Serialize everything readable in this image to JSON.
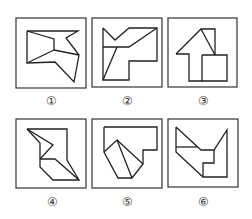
{
  "figures": [
    {
      "label": "①",
      "frame": [
        16,
        18,
        70,
        70
      ],
      "label_pos": [
        51,
        101
      ],
      "polylines": [
        [
          [
            27,
            31
          ],
          [
            78,
            31
          ],
          [
            66,
            38
          ],
          [
            79,
            55
          ],
          [
            74,
            82
          ],
          [
            55,
            62
          ],
          [
            27,
            63
          ],
          [
            27,
            31
          ]
        ],
        [
          [
            27,
            31
          ],
          [
            54,
            39
          ],
          [
            54,
            50
          ]
        ],
        [
          [
            54,
            50
          ],
          [
            27,
            63
          ]
        ],
        [
          [
            54,
            50
          ],
          [
            79,
            55
          ]
        ]
      ]
    },
    {
      "label": "②",
      "frame": [
        92,
        18,
        70,
        69
      ],
      "label_pos": [
        127,
        101
      ],
      "polylines": [
        [
          [
            103,
            28
          ],
          [
            115,
            40
          ],
          [
            129,
            28
          ],
          [
            157,
            28
          ],
          [
            157,
            61
          ],
          [
            129,
            61
          ],
          [
            129,
            80
          ],
          [
            103,
            80
          ],
          [
            103,
            28
          ]
        ],
        [
          [
            103,
            47
          ],
          [
            129,
            47
          ],
          [
            157,
            28
          ]
        ],
        [
          [
            117,
            47
          ],
          [
            103,
            80
          ]
        ]
      ]
    },
    {
      "label": "③",
      "frame": [
        168,
        18,
        69,
        69
      ],
      "label_pos": [
        203,
        101
      ],
      "polylines": [
        [
          [
            176,
            54
          ],
          [
            201,
            29
          ],
          [
            215,
            29
          ],
          [
            215,
            55
          ]
        ],
        [
          [
            201,
            29
          ],
          [
            215,
            55
          ]
        ],
        [
          [
            176,
            54
          ],
          [
            189,
            54
          ],
          [
            189,
            81
          ],
          [
            202,
            81
          ]
        ],
        [
          [
            202,
            55
          ],
          [
            227,
            55
          ],
          [
            227,
            81
          ],
          [
            202,
            81
          ],
          [
            202,
            55
          ]
        ]
      ]
    },
    {
      "label": "④",
      "frame": [
        16,
        119,
        70,
        69
      ],
      "label_pos": [
        52,
        202
      ],
      "polylines": [
        [
          [
            27,
            129
          ],
          [
            67,
            129
          ],
          [
            67,
            160
          ],
          [
            79,
            180
          ],
          [
            53,
            180
          ],
          [
            40,
            167
          ],
          [
            40,
            143
          ],
          [
            27,
            129
          ]
        ],
        [
          [
            27,
            129
          ],
          [
            53,
            145
          ],
          [
            40,
            159
          ]
        ],
        [
          [
            40,
            159
          ],
          [
            55,
            159
          ],
          [
            79,
            180
          ]
        ]
      ]
    },
    {
      "label": "⑤",
      "frame": [
        92,
        119,
        70,
        69
      ],
      "label_pos": [
        127,
        202
      ],
      "polylines": [
        [
          [
            104,
            127
          ],
          [
            157,
            127
          ],
          [
            157,
            150
          ],
          [
            143,
            150
          ],
          [
            143,
            164
          ],
          [
            132,
            178
          ],
          [
            118,
            178
          ],
          [
            104,
            152
          ],
          [
            104,
            127
          ]
        ],
        [
          [
            104,
            152
          ],
          [
            117,
            140
          ],
          [
            132,
            178
          ]
        ],
        [
          [
            117,
            140
          ],
          [
            143,
            164
          ]
        ]
      ]
    },
    {
      "label": "⑥",
      "frame": [
        168,
        119,
        70,
        68
      ],
      "label_pos": [
        203,
        202
      ],
      "polylines": [
        [
          [
            176,
            127
          ],
          [
            201,
            150
          ],
          [
            214,
            150
          ],
          [
            227,
            130
          ],
          [
            227,
            177
          ],
          [
            203,
            177
          ],
          [
            176,
            152
          ],
          [
            176,
            127
          ]
        ],
        [
          [
            176,
            147
          ],
          [
            197,
            147
          ]
        ],
        [
          [
            214,
            150
          ],
          [
            214,
            163
          ],
          [
            203,
            163
          ],
          [
            203,
            177
          ]
        ]
      ]
    }
  ],
  "colors": {
    "stroke": "#222222",
    "frame": "#333333",
    "background": "#ffffff"
  }
}
